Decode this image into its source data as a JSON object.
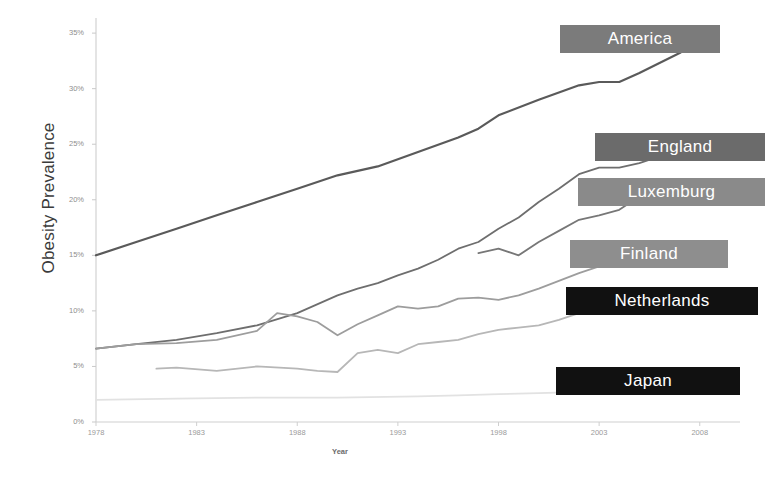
{
  "chart_data": {
    "type": "line",
    "title": "",
    "xlabel": "Year",
    "ylabel": "Obesity Prevalence",
    "xlim": [
      1978,
      2010
    ],
    "ylim": [
      0,
      36
    ],
    "grid": false,
    "legend_position": "inline-right-labels",
    "x_ticks": [
      "1978",
      "1983",
      "1988",
      "1993",
      "1998",
      "2003",
      "2008"
    ],
    "x_tick_values": [
      1978,
      1983,
      1988,
      1993,
      1998,
      2003,
      2008
    ],
    "y_ticks": [
      "0%",
      "5%",
      "10%",
      "15%",
      "20%",
      "25%",
      "30%",
      "35%"
    ],
    "y_tick_values": [
      0,
      5,
      10,
      15,
      20,
      25,
      30,
      35
    ],
    "series": [
      {
        "name": "America",
        "color": "#5a5a5a",
        "label_bg": "#7b7b7b",
        "label_text_color": "#ffffff",
        "x": [
          1978,
          1980,
          1982,
          1984,
          1986,
          1988,
          1990,
          1992,
          1994,
          1996,
          1997,
          1998,
          2000,
          2002,
          2003,
          2004,
          2005,
          2006,
          2007,
          2008
        ],
        "values": [
          15.0,
          16.2,
          17.4,
          18.6,
          19.8,
          21.0,
          22.2,
          23.0,
          24.3,
          25.6,
          26.4,
          27.6,
          29.0,
          30.3,
          30.6,
          30.6,
          31.4,
          32.3,
          33.2,
          34.3
        ]
      },
      {
        "name": "England",
        "color": "#6e6e6e",
        "label_bg": "#6b6b6b",
        "label_text_color": "#ffffff",
        "x": [
          1978,
          1980,
          1982,
          1984,
          1986,
          1988,
          1990,
          1991,
          1992,
          1993,
          1994,
          1995,
          1996,
          1997,
          1998,
          1999,
          2000,
          2001,
          2002,
          2003,
          2004,
          2005,
          2006,
          2007
        ],
        "values": [
          6.6,
          7.0,
          7.4,
          8.0,
          8.7,
          9.8,
          11.4,
          12.0,
          12.5,
          13.2,
          13.8,
          14.6,
          15.6,
          16.2,
          17.4,
          18.4,
          19.8,
          21.0,
          22.3,
          22.9,
          22.9,
          23.3,
          23.9,
          24.5
        ]
      },
      {
        "name": "Luxemburg",
        "color": "#777777",
        "label_bg": "#8a8a8a",
        "label_text_color": "#ffffff",
        "x": [
          1997,
          1998,
          1999,
          2000,
          2001,
          2002,
          2003,
          2004,
          2005,
          2006
        ],
        "values": [
          15.2,
          15.6,
          15.0,
          16.2,
          17.2,
          18.2,
          18.6,
          19.1,
          20.3,
          19.6
        ]
      },
      {
        "name": "Finland",
        "color": "#9d9d9d",
        "label_bg": "#8e8e8e",
        "label_text_color": "#ffffff",
        "x": [
          1978,
          1980,
          1982,
          1984,
          1986,
          1987,
          1988,
          1989,
          1990,
          1991,
          1992,
          1993,
          1994,
          1995,
          1996,
          1997,
          1998,
          1999,
          2000,
          2001,
          2002,
          2003,
          2004,
          2005,
          2006,
          2007
        ],
        "values": [
          6.6,
          7.0,
          7.1,
          7.4,
          8.2,
          9.8,
          9.5,
          9.0,
          7.8,
          8.8,
          9.6,
          10.4,
          10.2,
          10.4,
          11.1,
          11.2,
          11.0,
          11.4,
          12.0,
          12.7,
          13.4,
          14.0,
          14.3,
          14.4,
          14.4,
          14.6
        ]
      },
      {
        "name": "Netherlands",
        "color": "#b7b7b7",
        "label_bg": "#111111",
        "label_text_color": "#ffffff",
        "x": [
          1981,
          1982,
          1984,
          1986,
          1988,
          1989,
          1990,
          1991,
          1992,
          1993,
          1994,
          1995,
          1996,
          1997,
          1998,
          1999,
          2000,
          2001,
          2002,
          2003,
          2004,
          2005,
          2006,
          2007
        ],
        "values": [
          4.8,
          4.9,
          4.6,
          5.0,
          4.8,
          4.6,
          4.5,
          6.2,
          6.5,
          6.2,
          7.0,
          7.2,
          7.4,
          7.9,
          8.3,
          8.5,
          8.7,
          9.2,
          9.8,
          10.2,
          10.6,
          11.0,
          11.2,
          11.2
        ]
      },
      {
        "name": "Japan",
        "color": "#e2e2e2",
        "label_bg": "#111111",
        "label_text_color": "#ffffff",
        "x": [
          1978,
          1982,
          1986,
          1990,
          1994,
          1996,
          1998,
          2000,
          2002,
          2004,
          2005,
          2006,
          2007,
          2008
        ],
        "values": [
          2.0,
          2.1,
          2.2,
          2.2,
          2.3,
          2.4,
          2.5,
          2.6,
          2.7,
          3.0,
          3.1,
          3.0,
          3.1,
          3.3
        ]
      }
    ],
    "series_labels": [
      {
        "name": "America",
        "x": 560,
        "y": 25,
        "width": 160,
        "height": 28,
        "bg": "#7b7b7b"
      },
      {
        "name": "England",
        "x": 595,
        "y": 133,
        "width": 170,
        "height": 28,
        "bg": "#6b6b6b"
      },
      {
        "name": "Luxemburg",
        "x": 578,
        "y": 178,
        "width": 187,
        "height": 28,
        "bg": "#8a8a8a"
      },
      {
        "name": "Finland",
        "x": 570,
        "y": 240,
        "width": 158,
        "height": 28,
        "bg": "#8e8e8e"
      },
      {
        "name": "Netherlands",
        "x": 566,
        "y": 287,
        "width": 192,
        "height": 28,
        "bg": "#111111"
      },
      {
        "name": "Japan",
        "x": 556,
        "y": 367,
        "width": 184,
        "height": 28,
        "bg": "#111111"
      }
    ]
  }
}
